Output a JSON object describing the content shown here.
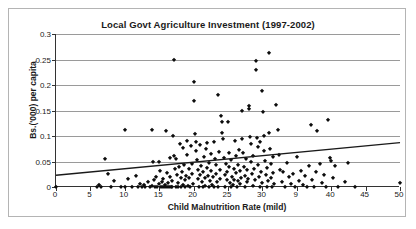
{
  "chart_data": {
    "type": "scatter",
    "title": "Local Govt Agriculture Investment (1997-2002)",
    "xlabel": "Child Malnutrition Rate (mild)",
    "ylabel": "Bs.('000) per capita",
    "xlim": [
      0,
      50
    ],
    "ylim": [
      0,
      0.3
    ],
    "xticks": [
      0,
      5,
      10,
      15,
      20,
      25,
      30,
      35,
      40,
      45,
      50
    ],
    "xticklabels": [
      "0",
      "5",
      "10",
      "15",
      "20",
      "25",
      "30",
      "9",
      "40",
      "45",
      "50"
    ],
    "yticks": [
      0,
      0.05,
      0.1,
      0.15,
      0.2,
      0.25,
      0.3
    ],
    "yticklabels": [
      "0",
      "0.05",
      "0.1",
      "0.15",
      "0.2",
      "0.25",
      "0.3"
    ],
    "grid": "horizontal",
    "legend": null,
    "marker": "diamond",
    "marker_color": "#0d0d0d",
    "trendline": {
      "type": "linear",
      "color": "#1a1a1a",
      "x0": 0,
      "y0": 0.023,
      "x1": 50,
      "y1": 0.087
    },
    "points": [
      [
        0.0,
        0.0
      ],
      [
        6.0,
        0.0
      ],
      [
        6.2,
        0.004
      ],
      [
        6.6,
        0.0
      ],
      [
        7.1,
        0.055
      ],
      [
        7.6,
        0.026
      ],
      [
        8.0,
        0.0
      ],
      [
        8.4,
        0.011
      ],
      [
        9.4,
        0.0
      ],
      [
        10.0,
        0.111
      ],
      [
        10.1,
        0.0
      ],
      [
        10.4,
        0.015
      ],
      [
        11.0,
        0.0
      ],
      [
        11.6,
        0.022
      ],
      [
        11.9,
        0.0
      ],
      [
        12.2,
        0.006
      ],
      [
        12.5,
        0.0
      ],
      [
        12.8,
        0.003
      ],
      [
        13.0,
        0.0
      ],
      [
        13.3,
        0.01
      ],
      [
        13.6,
        0.0
      ],
      [
        13.9,
        0.002
      ],
      [
        14.0,
        0.111
      ],
      [
        14.1,
        0.049
      ],
      [
        14.2,
        0.013
      ],
      [
        14.4,
        0.0
      ],
      [
        14.6,
        0.02
      ],
      [
        14.7,
        0.0
      ],
      [
        14.9,
        0.005
      ],
      [
        15.0,
        0.049
      ],
      [
        15.1,
        0.031
      ],
      [
        15.2,
        0.0
      ],
      [
        15.4,
        0.009
      ],
      [
        15.5,
        0.0
      ],
      [
        15.6,
        0.016
      ],
      [
        15.8,
        0.003
      ],
      [
        15.9,
        0.0
      ],
      [
        16.0,
        0.11
      ],
      [
        16.1,
        0.028
      ],
      [
        16.2,
        0.0
      ],
      [
        16.3,
        0.008
      ],
      [
        16.4,
        0.0
      ],
      [
        16.5,
        0.057
      ],
      [
        16.6,
        0.019
      ],
      [
        16.7,
        0.0
      ],
      [
        16.8,
        0.012
      ],
      [
        16.9,
        0.0
      ],
      [
        17.0,
        0.1
      ],
      [
        17.1,
        0.06
      ],
      [
        17.2,
        0.25
      ],
      [
        17.3,
        0.035
      ],
      [
        17.4,
        0.0
      ],
      [
        17.5,
        0.054
      ],
      [
        17.6,
        0.023
      ],
      [
        17.7,
        0.0
      ],
      [
        17.8,
        0.007
      ],
      [
        17.9,
        0.04
      ],
      [
        18.0,
        0.085
      ],
      [
        18.1,
        0.017
      ],
      [
        18.2,
        0.0
      ],
      [
        18.3,
        0.03
      ],
      [
        18.4,
        0.003
      ],
      [
        18.5,
        0.077
      ],
      [
        18.6,
        0.044
      ],
      [
        18.7,
        0.0
      ],
      [
        18.8,
        0.014
      ],
      [
        18.9,
        0.022
      ],
      [
        19.0,
        0.09
      ],
      [
        19.1,
        0.062
      ],
      [
        19.2,
        0.001
      ],
      [
        19.3,
        0.036
      ],
      [
        19.4,
        0.018
      ],
      [
        19.5,
        0.0
      ],
      [
        19.6,
        0.08
      ],
      [
        19.7,
        0.025
      ],
      [
        19.8,
        0.046
      ],
      [
        19.9,
        0.006
      ],
      [
        20.0,
        0.205
      ],
      [
        20.1,
        0.168
      ],
      [
        20.2,
        0.103
      ],
      [
        20.3,
        0.088
      ],
      [
        20.4,
        0.07
      ],
      [
        20.5,
        0.052
      ],
      [
        20.6,
        0.033
      ],
      [
        20.7,
        0.015
      ],
      [
        20.8,
        0.0
      ],
      [
        20.9,
        0.024
      ],
      [
        21.0,
        0.083
      ],
      [
        21.1,
        0.041
      ],
      [
        21.2,
        0.009
      ],
      [
        21.3,
        0.0
      ],
      [
        21.4,
        0.029
      ],
      [
        21.5,
        0.059
      ],
      [
        21.6,
        0.017
      ],
      [
        21.7,
        0.002
      ],
      [
        21.8,
        0.075
      ],
      [
        21.9,
        0.038
      ],
      [
        22.0,
        0.086
      ],
      [
        22.1,
        0.021
      ],
      [
        22.2,
        0.0
      ],
      [
        22.3,
        0.048
      ],
      [
        22.4,
        0.012
      ],
      [
        22.5,
        0.064
      ],
      [
        22.6,
        0.031
      ],
      [
        22.7,
        0.004
      ],
      [
        22.8,
        0.019
      ],
      [
        22.9,
        0.0
      ],
      [
        23.0,
        0.088
      ],
      [
        23.1,
        0.055
      ],
      [
        23.2,
        0.026
      ],
      [
        23.3,
        0.043
      ],
      [
        23.4,
        0.01
      ],
      [
        23.5,
        0.0
      ],
      [
        23.6,
        0.181
      ],
      [
        23.7,
        0.068
      ],
      [
        23.8,
        0.034
      ],
      [
        23.9,
        0.016
      ],
      [
        24.0,
        0.14
      ],
      [
        24.1,
        0.127
      ],
      [
        24.2,
        0.105
      ],
      [
        24.3,
        0.095
      ],
      [
        24.4,
        0.057
      ],
      [
        24.5,
        0.023
      ],
      [
        24.6,
        0.0
      ],
      [
        24.7,
        0.046
      ],
      [
        24.8,
        0.013
      ],
      [
        24.9,
        0.03
      ],
      [
        25.0,
        0.128
      ],
      [
        25.1,
        0.066
      ],
      [
        25.2,
        0.039
      ],
      [
        25.3,
        0.008
      ],
      [
        25.4,
        0.0
      ],
      [
        25.5,
        0.052
      ],
      [
        25.6,
        0.02
      ],
      [
        25.7,
        0.003
      ],
      [
        25.8,
        0.035
      ],
      [
        25.9,
        0.014
      ],
      [
        26.0,
        0.09
      ],
      [
        26.1,
        0.06
      ],
      [
        26.2,
        0.027
      ],
      [
        26.3,
        0.0
      ],
      [
        26.4,
        0.044
      ],
      [
        26.5,
        0.011
      ],
      [
        26.6,
        0.073
      ],
      [
        26.7,
        0.031
      ],
      [
        26.8,
        0.005
      ],
      [
        26.9,
        0.018
      ],
      [
        27.0,
        0.149
      ],
      [
        27.1,
        0.094
      ],
      [
        27.2,
        0.067
      ],
      [
        27.3,
        0.04
      ],
      [
        27.4,
        0.022
      ],
      [
        27.5,
        0.0
      ],
      [
        27.6,
        0.055
      ],
      [
        27.7,
        0.009
      ],
      [
        27.8,
        0.033
      ],
      [
        27.9,
        0.016
      ],
      [
        28.0,
        0.158
      ],
      [
        28.1,
        0.152
      ],
      [
        28.2,
        0.099
      ],
      [
        28.3,
        0.085
      ],
      [
        28.4,
        0.049
      ],
      [
        28.5,
        0.025
      ],
      [
        28.6,
        0.002
      ],
      [
        28.7,
        0.06
      ],
      [
        28.8,
        0.036
      ],
      [
        28.9,
        0.013
      ],
      [
        29.0,
        0.248
      ],
      [
        29.1,
        0.229
      ],
      [
        29.2,
        0.096
      ],
      [
        29.3,
        0.079
      ],
      [
        29.4,
        0.043
      ],
      [
        29.5,
        0.019
      ],
      [
        29.6,
        0.0
      ],
      [
        29.7,
        0.088
      ],
      [
        29.8,
        0.029
      ],
      [
        29.9,
        0.007
      ],
      [
        30.0,
        0.188
      ],
      [
        30.1,
        0.147
      ],
      [
        30.2,
        0.1
      ],
      [
        30.3,
        0.07
      ],
      [
        30.4,
        0.051
      ],
      [
        30.5,
        0.024
      ],
      [
        30.6,
        0.0
      ],
      [
        30.7,
        0.038
      ],
      [
        30.8,
        0.012
      ],
      [
        30.9,
        0.263
      ],
      [
        31.0,
        0.106
      ],
      [
        31.1,
        0.075
      ],
      [
        31.2,
        0.045
      ],
      [
        31.3,
        0.017
      ],
      [
        31.4,
        0.0
      ],
      [
        31.5,
        0.059
      ],
      [
        31.6,
        0.028
      ],
      [
        31.7,
        0.005
      ],
      [
        32.0,
        0.161
      ],
      [
        32.2,
        0.112
      ],
      [
        32.4,
        0.063
      ],
      [
        32.6,
        0.034
      ],
      [
        32.8,
        0.01
      ],
      [
        33.0,
        0.03
      ],
      [
        33.3,
        0.0
      ],
      [
        33.6,
        0.048
      ],
      [
        33.9,
        0.02
      ],
      [
        34.2,
        0.006
      ],
      [
        34.5,
        0.026
      ],
      [
        34.8,
        0.0
      ],
      [
        35.0,
        0.058
      ],
      [
        35.3,
        0.011
      ],
      [
        35.6,
        0.032
      ],
      [
        35.9,
        0.003
      ],
      [
        36.2,
        0.021
      ],
      [
        36.5,
        0.0
      ],
      [
        36.8,
        0.042
      ],
      [
        37.0,
        0.122
      ],
      [
        37.2,
        0.014
      ],
      [
        37.5,
        0.0
      ],
      [
        37.8,
        0.029
      ],
      [
        38.0,
        0.11
      ],
      [
        38.3,
        0.046
      ],
      [
        38.6,
        0.008
      ],
      [
        38.9,
        0.024
      ],
      [
        39.2,
        0.0
      ],
      [
        39.5,
        0.132
      ],
      [
        39.8,
        0.056
      ],
      [
        40.0,
        0.051
      ],
      [
        40.3,
        0.018
      ],
      [
        40.6,
        0.041
      ],
      [
        41.0,
        0.0
      ],
      [
        42.0,
        0.009
      ],
      [
        42.5,
        0.048
      ],
      [
        43.5,
        0.0
      ],
      [
        50.0,
        0.008
      ]
    ]
  }
}
